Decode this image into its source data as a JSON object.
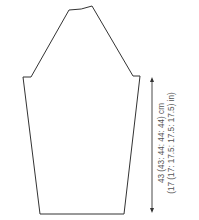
{
  "diagram": {
    "type": "sleeve-schematic",
    "measurement": {
      "length_cm": "43 (43: 44: 44: 44) cm",
      "length_in": "(17 (17: 17.5: 17.5: 17.5) in)"
    },
    "colors": {
      "outline": "#333333",
      "text": "#555555"
    }
  }
}
